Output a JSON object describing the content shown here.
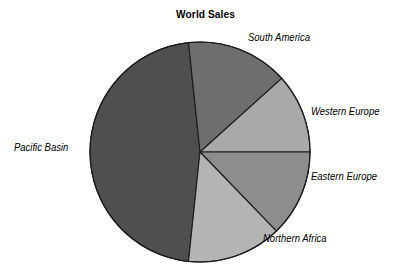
{
  "chart_data": {
    "type": "pie",
    "title": "World Sales",
    "xlabel": "",
    "ylabel": "",
    "legend_position": "outside-labels",
    "grid": false,
    "categories": [
      "Pacific Basin",
      "South America",
      "Western Europe",
      "Eastern Europe",
      "Northern Africa"
    ],
    "values": [
      47,
      15,
      11,
      13,
      14
    ],
    "units": "percent",
    "colors": [
      "#4f4f4f",
      "#6e6e6e",
      "#a9a9a9",
      "#8d8d8d",
      "#b4b4b4"
    ],
    "slices": [
      {
        "label": "Pacific Basin",
        "value": 47,
        "color": "#4f4f4f",
        "start_angle": 96,
        "end_angle": 264
      },
      {
        "label": "South America",
        "value": 15,
        "color": "#6e6e6e",
        "start_angle": 264,
        "end_angle": 318
      },
      {
        "label": "Western Europe",
        "value": 11,
        "color": "#a9a9a9",
        "start_angle": 318,
        "end_angle": 360
      },
      {
        "label": "Eastern Europe",
        "value": 13,
        "color": "#8d8d8d",
        "start_angle": 0,
        "end_angle": 46
      },
      {
        "label": "Northern Africa",
        "value": 14,
        "color": "#b4b4b4",
        "start_angle": 46,
        "end_angle": 96
      }
    ],
    "annotations": []
  },
  "labels": {
    "pacific_basin": "Pacific Basin",
    "south_america": "South America",
    "western_europe": "Western Europe",
    "eastern_europe": "Eastern Europe",
    "northern_africa": "Northern Africa"
  },
  "style": {
    "background": "#ffffff",
    "outline": "#1a1a1a",
    "text_color": "#000000"
  },
  "geometry": {
    "center_x": 200,
    "center_y": 152,
    "radius": 110
  }
}
